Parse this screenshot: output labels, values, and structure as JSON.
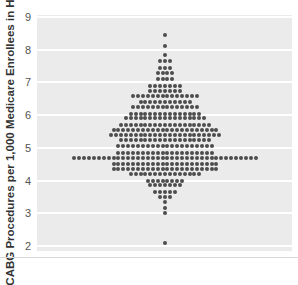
{
  "chart_data": {
    "type": "scatter",
    "subtype": "dot-plot (beeswarm)",
    "title": "",
    "xlabel": "",
    "ylabel": "CABG Procedures per 1,000 Medicare Enrollees in HRRs",
    "ylim": [
      2,
      9
    ],
    "yticks": [
      2,
      3,
      4,
      5,
      6,
      7,
      8,
      9
    ],
    "grid": true,
    "legend": null,
    "rows": [
      {
        "y": 8.45,
        "count": 1
      },
      {
        "y": 8.1,
        "count": 1
      },
      {
        "y": 7.85,
        "count": 1
      },
      {
        "y": 7.65,
        "count": 3
      },
      {
        "y": 7.45,
        "count": 3
      },
      {
        "y": 7.3,
        "count": 4
      },
      {
        "y": 7.1,
        "count": 4
      },
      {
        "y": 6.9,
        "count": 7
      },
      {
        "y": 6.75,
        "count": 7
      },
      {
        "y": 6.6,
        "count": 14
      },
      {
        "y": 6.4,
        "count": 11
      },
      {
        "y": 6.25,
        "count": 14
      },
      {
        "y": 6.05,
        "count": 15
      },
      {
        "y": 5.9,
        "count": 17
      },
      {
        "y": 5.7,
        "count": 19
      },
      {
        "y": 5.55,
        "count": 22
      },
      {
        "y": 5.4,
        "count": 23
      },
      {
        "y": 5.25,
        "count": 19
      },
      {
        "y": 5.05,
        "count": 20
      },
      {
        "y": 4.85,
        "count": 20
      },
      {
        "y": 4.7,
        "count": 38
      },
      {
        "y": 4.5,
        "count": 22
      },
      {
        "y": 4.35,
        "count": 22
      },
      {
        "y": 4.2,
        "count": 15
      },
      {
        "y": 4.0,
        "count": 8
      },
      {
        "y": 3.85,
        "count": 7
      },
      {
        "y": 3.65,
        "count": 5
      },
      {
        "y": 3.5,
        "count": 3
      },
      {
        "y": 3.35,
        "count": 1
      },
      {
        "y": 3.15,
        "count": 1
      },
      {
        "y": 3.0,
        "count": 1
      },
      {
        "y": 2.1,
        "count": 1
      }
    ],
    "colors": {
      "dot": "#4d4d4d",
      "panel": "#ebebeb",
      "grid": "#ffffff"
    }
  }
}
